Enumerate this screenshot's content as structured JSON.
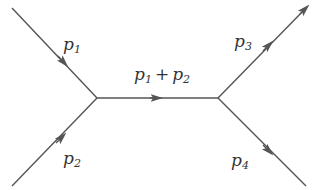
{
  "diagram": {
    "type": "feynman-diagram",
    "line_color": "#555555",
    "vertices": [
      {
        "id": "v1",
        "x": 97,
        "y": 98
      },
      {
        "id": "v2",
        "x": 218,
        "y": 98
      }
    ],
    "edges": [
      {
        "id": "p1",
        "from": [
          12,
          8
        ],
        "to": [
          97,
          98
        ],
        "label_base": "p",
        "label_sub": "1",
        "direction": "in"
      },
      {
        "id": "p2",
        "from": [
          12,
          186
        ],
        "to": [
          97,
          98
        ],
        "label_base": "p",
        "label_sub": "2",
        "direction": "in"
      },
      {
        "id": "p12",
        "from": [
          97,
          98
        ],
        "to": [
          218,
          98
        ],
        "label": "p1 + p2",
        "direction": "internal"
      },
      {
        "id": "p3",
        "from": [
          218,
          98
        ],
        "to": [
          306,
          8
        ],
        "label_base": "p",
        "label_sub": "3",
        "direction": "out"
      },
      {
        "id": "p4",
        "from": [
          218,
          98
        ],
        "to": [
          306,
          186
        ],
        "label_base": "p",
        "label_sub": "4",
        "direction": "out"
      }
    ],
    "labels": {
      "p1": {
        "base": "p",
        "sub": "1"
      },
      "p2": {
        "base": "p",
        "sub": "2"
      },
      "p3": {
        "base": "p",
        "sub": "3"
      },
      "p4": {
        "base": "p",
        "sub": "4"
      },
      "mid": {
        "a_base": "p",
        "a_sub": "1",
        "plus": "+",
        "b_base": "p",
        "b_sub": "2"
      }
    }
  }
}
